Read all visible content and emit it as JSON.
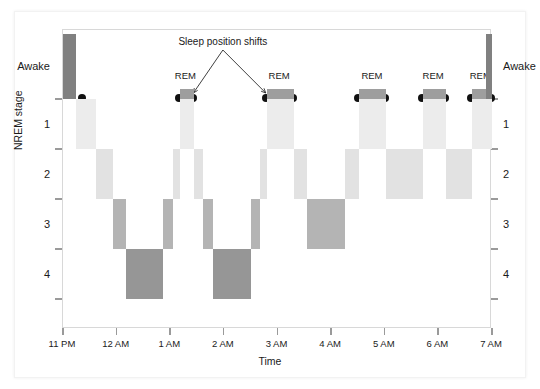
{
  "figure": {
    "kind": "hypnogram",
    "background": "#ffffff"
  },
  "axes": {
    "y_title": "NREM stage",
    "x_title": "Time",
    "y_labels_left": [
      "Awake",
      "1",
      "2",
      "3",
      "4"
    ],
    "y_labels_right": [
      "Awake",
      "1",
      "2",
      "3",
      "4"
    ],
    "x_tick_labels": [
      "11 PM",
      "12 AM",
      "1 AM",
      "2 AM",
      "3 AM",
      "4 AM",
      "5 AM",
      "6 AM",
      "7 AM"
    ],
    "x_range_hours": [
      23,
      31
    ],
    "y_stage_order": [
      "Awake",
      "REM",
      "1",
      "2",
      "3",
      "4"
    ]
  },
  "annotation": {
    "label": "Sleep position shifts",
    "rem_label": "REM",
    "rem_label_count": 5
  },
  "colors": {
    "awake": "#808080",
    "rem": "#9e9e9e",
    "stage1": "#ececec",
    "stage2": "#e2e2e2",
    "stage3": "#b4b4b4",
    "stage4": "#969696",
    "axis": "#d8d8d8",
    "tick": "#9a9a9a",
    "text": "#1a1a1a",
    "dot": "#111111"
  },
  "chart_data": {
    "type": "area",
    "xlabel": "Time",
    "ylabel": "NREM stage",
    "xlim": [
      23,
      31
    ],
    "x_tick_labels": [
      "11 PM",
      "12 AM",
      "1 AM",
      "2 AM",
      "3 AM",
      "4 AM",
      "5 AM",
      "6 AM",
      "7 AM"
    ],
    "x_tick_values": [
      23,
      24,
      25,
      26,
      27,
      28,
      29,
      30,
      31
    ],
    "y_categories": [
      "Awake",
      "REM",
      "1",
      "2",
      "3",
      "4"
    ],
    "grid": false,
    "legend": "none",
    "segments": [
      {
        "stage": "Awake",
        "start": 23.0,
        "end": 23.25
      },
      {
        "stage": "1",
        "start": 23.25,
        "end": 23.62
      },
      {
        "stage": "2",
        "start": 23.62,
        "end": 23.93
      },
      {
        "stage": "3",
        "start": 23.93,
        "end": 24.18
      },
      {
        "stage": "4",
        "start": 24.18,
        "end": 24.87
      },
      {
        "stage": "3",
        "start": 24.87,
        "end": 25.06
      },
      {
        "stage": "2",
        "start": 25.06,
        "end": 25.18
      },
      {
        "stage": "REM",
        "start": 25.18,
        "end": 25.45
      },
      {
        "stage": "1",
        "start": 25.18,
        "end": 25.45
      },
      {
        "stage": "2",
        "start": 25.45,
        "end": 25.62
      },
      {
        "stage": "3",
        "start": 25.62,
        "end": 25.8
      },
      {
        "stage": "4",
        "start": 25.8,
        "end": 26.5
      },
      {
        "stage": "3",
        "start": 26.5,
        "end": 26.68
      },
      {
        "stage": "2",
        "start": 26.68,
        "end": 26.8
      },
      {
        "stage": "REM",
        "start": 26.8,
        "end": 27.3
      },
      {
        "stage": "1",
        "start": 26.8,
        "end": 27.3
      },
      {
        "stage": "2",
        "start": 27.3,
        "end": 27.55
      },
      {
        "stage": "3",
        "start": 27.55,
        "end": 28.25
      },
      {
        "stage": "2",
        "start": 28.25,
        "end": 28.52
      },
      {
        "stage": "REM",
        "start": 28.52,
        "end": 29.02
      },
      {
        "stage": "1",
        "start": 28.52,
        "end": 29.02
      },
      {
        "stage": "2",
        "start": 29.02,
        "end": 29.72
      },
      {
        "stage": "REM",
        "start": 29.72,
        "end": 30.15
      },
      {
        "stage": "1",
        "start": 29.72,
        "end": 30.15
      },
      {
        "stage": "2",
        "start": 30.15,
        "end": 30.62
      },
      {
        "stage": "REM",
        "start": 30.62,
        "end": 31.0
      },
      {
        "stage": "1",
        "start": 30.62,
        "end": 31.0
      },
      {
        "stage": "Awake",
        "start": 30.88,
        "end": 31.0
      }
    ],
    "position_shift_times": [
      23.38,
      25.18,
      25.45,
      26.8,
      27.3,
      28.52,
      29.02,
      29.72,
      30.15,
      30.62,
      31.0
    ],
    "rem_labels": [
      {
        "text": "REM",
        "time": 25.3
      },
      {
        "text": "REM",
        "time": 27.05
      },
      {
        "text": "REM",
        "time": 28.78
      },
      {
        "text": "REM",
        "time": 29.92
      },
      {
        "text": "REM",
        "time": 30.8
      }
    ],
    "annotation": {
      "text": "Sleep position shifts",
      "text_time": 26.0,
      "targets": [
        25.45,
        26.8
      ]
    }
  }
}
